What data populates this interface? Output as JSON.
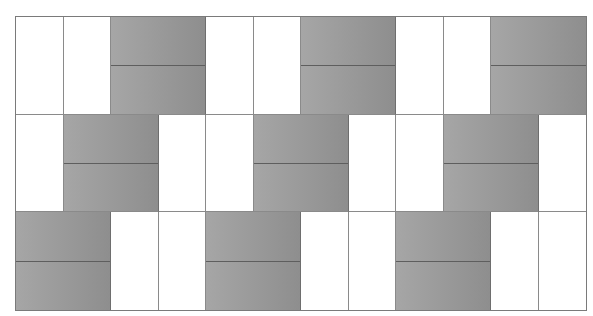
{
  "diagram": {
    "title": "",
    "columns": 12,
    "rows": [
      {
        "cells": [
          {
            "type": "white",
            "span": 1
          },
          {
            "type": "white",
            "span": 1
          },
          {
            "type": "gray",
            "span": 2
          },
          {
            "type": "white",
            "span": 1
          },
          {
            "type": "white",
            "span": 1
          },
          {
            "type": "gray",
            "span": 2
          },
          {
            "type": "white",
            "span": 1
          },
          {
            "type": "white",
            "span": 1
          },
          {
            "type": "gray",
            "span": 2
          }
        ]
      },
      {
        "cells": [
          {
            "type": "white",
            "span": 1
          },
          {
            "type": "gray",
            "span": 2
          },
          {
            "type": "white",
            "span": 1
          },
          {
            "type": "white",
            "span": 1
          },
          {
            "type": "gray",
            "span": 2
          },
          {
            "type": "white",
            "span": 1
          },
          {
            "type": "white",
            "span": 1
          },
          {
            "type": "gray",
            "span": 2
          },
          {
            "type": "white",
            "span": 1
          }
        ]
      },
      {
        "cells": [
          {
            "type": "gray",
            "span": 2
          },
          {
            "type": "white",
            "span": 1
          },
          {
            "type": "white",
            "span": 1
          },
          {
            "type": "gray",
            "span": 2
          },
          {
            "type": "white",
            "span": 1
          },
          {
            "type": "white",
            "span": 1
          },
          {
            "type": "gray",
            "span": 2
          },
          {
            "type": "white",
            "span": 1
          },
          {
            "type": "white",
            "span": 1
          }
        ]
      }
    ],
    "colors": {
      "gray_light": "#a6a6a6",
      "gray_dark": "#8e8e8e",
      "line": "#8a8a8a",
      "split_line": "#5e5e5e",
      "white": "#ffffff"
    }
  }
}
